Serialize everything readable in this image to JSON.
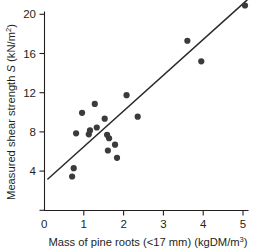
{
  "chart_data": {
    "type": "scatter",
    "title": "",
    "subtitle": "",
    "xlabel": "Mass of pine roots (<17 mm) (kgDM/m3)",
    "xlabel_parts": {
      "main": "Mass of pine roots (<17 mm) (kgDM/m",
      "superscript": "3",
      "tail": ")"
    },
    "ylabel": "Measured shear strength S (kN/m2)",
    "ylabel_parts": {
      "lead": "Measured shear strength ",
      "italic": "S",
      "mid": " (kN/m",
      "superscript": "2",
      "tail": ")"
    },
    "xlim": [
      0,
      5.1
    ],
    "ylim": [
      0,
      21.8
    ],
    "xticks": [
      0,
      1,
      2,
      3,
      4,
      5
    ],
    "xtick_labels": [
      "0",
      "1",
      "2",
      "3",
      "4",
      "5"
    ],
    "yticks": [
      4,
      8,
      12,
      16,
      20
    ],
    "ytick_labels": [
      "4",
      "8",
      "12",
      "16",
      "20"
    ],
    "y_origin_tick_label": "0",
    "grid": false,
    "legend": null,
    "marker": "filled-circle",
    "marker_color": "#3b3b3b",
    "line_color": "#2b2b2b",
    "points": [
      {
        "x": 0.7,
        "y": 3.45
      },
      {
        "x": 0.74,
        "y": 4.3
      },
      {
        "x": 0.8,
        "y": 7.85
      },
      {
        "x": 0.95,
        "y": 9.95
      },
      {
        "x": 1.12,
        "y": 7.75
      },
      {
        "x": 1.15,
        "y": 8.15
      },
      {
        "x": 1.27,
        "y": 10.85
      },
      {
        "x": 1.32,
        "y": 8.45
      },
      {
        "x": 1.52,
        "y": 9.35
      },
      {
        "x": 1.58,
        "y": 7.7
      },
      {
        "x": 1.63,
        "y": 7.35
      },
      {
        "x": 1.6,
        "y": 6.1
      },
      {
        "x": 1.78,
        "y": 6.7
      },
      {
        "x": 1.83,
        "y": 5.35
      },
      {
        "x": 2.07,
        "y": 11.75
      },
      {
        "x": 2.35,
        "y": 9.55
      },
      {
        "x": 3.6,
        "y": 17.3
      },
      {
        "x": 3.95,
        "y": 15.2
      },
      {
        "x": 5.05,
        "y": 20.9
      }
    ],
    "fit_line": {
      "x0": 0.09,
      "y0": 3.2,
      "x1": 5.1,
      "y1": 21.45
    }
  }
}
